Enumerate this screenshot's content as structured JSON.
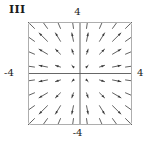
{
  "figure": {
    "panel_label": "III",
    "caption": "",
    "background_color": "#ffffff",
    "frame_color": "#aeaeae",
    "axis_color": "#555555",
    "arrow_color": "#3a3a3a"
  },
  "axes": {
    "top_label": "4",
    "bottom_label": "-4",
    "left_label": "-4",
    "right_label": "4"
  },
  "chart_data": {
    "type": "quiver",
    "title": "III",
    "xlabel": "",
    "ylabel": "",
    "xlim": [
      -4,
      4
    ],
    "ylim": [
      -4,
      4
    ],
    "xtick_labels": [
      "-4",
      "4"
    ],
    "ytick_labels": [
      "-4",
      "4"
    ],
    "grid": false,
    "legend": null,
    "field_formula": "F(x, y) = <x, y>",
    "grid_n": 8,
    "grid_x": [
      -3.5,
      -2.5,
      -1.5,
      -0.5,
      0.5,
      1.5,
      2.5,
      3.5
    ],
    "grid_y": [
      -3.5,
      -2.5,
      -1.5,
      -0.5,
      0.5,
      1.5,
      2.5,
      3.5
    ],
    "arrow_scale": 0.26,
    "arrow_head_length": 3.2,
    "arrow_head_width": 2.4,
    "quadrants": [
      {
        "name": "upper-left",
        "arrow_direction": "up-left"
      },
      {
        "name": "upper-right",
        "arrow_direction": "up-right"
      },
      {
        "name": "lower-left",
        "arrow_direction": "down-left"
      },
      {
        "name": "lower-right",
        "arrow_direction": "down-right"
      }
    ]
  }
}
